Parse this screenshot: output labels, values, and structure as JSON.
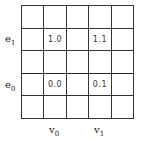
{
  "diagram": {
    "grid": {
      "rows": 5,
      "cols": 5
    },
    "row_labels": [
      {
        "base": "e",
        "sub": "1",
        "row": 1
      },
      {
        "base": "e",
        "sub": "0",
        "row": 3
      }
    ],
    "col_labels": [
      {
        "base": "v",
        "sub": "0",
        "col": 1
      },
      {
        "base": "v",
        "sub": "1",
        "col": 3
      }
    ],
    "cells": [
      [
        "",
        "",
        "",
        "",
        ""
      ],
      [
        "",
        "1.0",
        "",
        "1.1",
        ""
      ],
      [
        "",
        "",
        "",
        "",
        ""
      ],
      [
        "",
        "0.0",
        "",
        "0.1",
        ""
      ],
      [
        "",
        "",
        "",
        "",
        ""
      ]
    ]
  }
}
